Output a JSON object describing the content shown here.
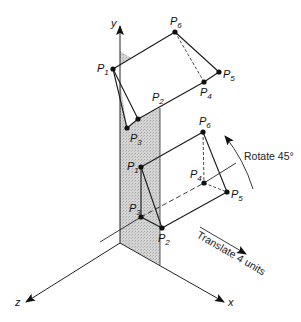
{
  "figure": {
    "axes": {
      "x": "x",
      "y": "y",
      "z": "z"
    },
    "upper_object": {
      "points": {
        "P1": "P1",
        "P2": "P2",
        "P3": "P3",
        "P4": "P4",
        "P5": "P5",
        "P6": "P6"
      }
    },
    "lower_object": {
      "points": {
        "P1": "P1",
        "P2": "P2",
        "P3": "P3",
        "P4": "P4",
        "P5": "P5",
        "P6": "P6"
      }
    },
    "annotations": {
      "rotate": "Rotate 45°",
      "translate": "Translate 4 units"
    },
    "colors": {
      "line": "#1a1a1a",
      "shade": "#cfcfcf"
    }
  }
}
